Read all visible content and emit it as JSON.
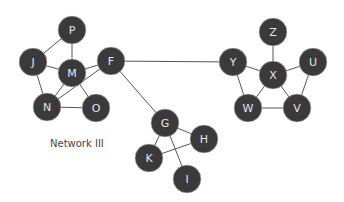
{
  "caption": "Network III",
  "colors": {
    "node_fill": "#3a3a3a",
    "node_text": "#e6e6e6",
    "edge": "#555555"
  },
  "nodes": [
    {
      "id": "P",
      "x": 72,
      "y": 30
    },
    {
      "id": "J",
      "x": 33,
      "y": 62
    },
    {
      "id": "M",
      "x": 72,
      "y": 73
    },
    {
      "id": "F",
      "x": 111,
      "y": 61
    },
    {
      "id": "N",
      "x": 47,
      "y": 107
    },
    {
      "id": "O",
      "x": 96,
      "y": 108
    },
    {
      "id": "G",
      "x": 165,
      "y": 123
    },
    {
      "id": "H",
      "x": 204,
      "y": 139
    },
    {
      "id": "K",
      "x": 149,
      "y": 158
    },
    {
      "id": "I",
      "x": 187,
      "y": 179
    },
    {
      "id": "Z",
      "x": 273,
      "y": 32
    },
    {
      "id": "Y",
      "x": 233,
      "y": 62
    },
    {
      "id": "X",
      "x": 273,
      "y": 75
    },
    {
      "id": "U",
      "x": 313,
      "y": 62
    },
    {
      "id": "W",
      "x": 248,
      "y": 108
    },
    {
      "id": "V",
      "x": 297,
      "y": 108
    }
  ],
  "edges": [
    [
      "P",
      "J"
    ],
    [
      "P",
      "M"
    ],
    [
      "J",
      "M"
    ],
    [
      "J",
      "N"
    ],
    [
      "M",
      "F"
    ],
    [
      "M",
      "N"
    ],
    [
      "M",
      "O"
    ],
    [
      "N",
      "O"
    ],
    [
      "N",
      "F"
    ],
    [
      "F",
      "Y"
    ],
    [
      "F",
      "G"
    ],
    [
      "G",
      "H"
    ],
    [
      "G",
      "K"
    ],
    [
      "G",
      "I"
    ],
    [
      "K",
      "H"
    ],
    [
      "Z",
      "X"
    ],
    [
      "Y",
      "X"
    ],
    [
      "U",
      "X"
    ],
    [
      "Y",
      "W"
    ],
    [
      "W",
      "X"
    ],
    [
      "X",
      "V"
    ],
    [
      "U",
      "V"
    ],
    [
      "W",
      "V"
    ]
  ]
}
